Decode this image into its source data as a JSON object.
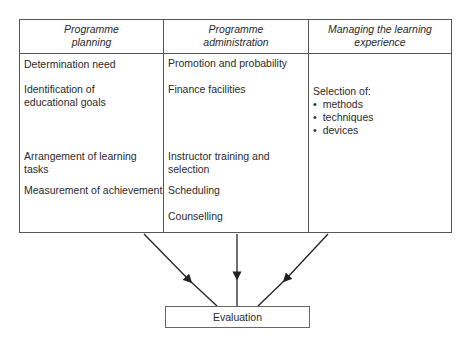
{
  "diagram": {
    "columns": [
      {
        "header": "Programme planning",
        "header_lines": [
          "Programme",
          "planning"
        ],
        "items": [
          {
            "lines": [
              "Determination need"
            ]
          },
          {
            "lines": [
              "Identification of",
              "educational goals"
            ]
          },
          {
            "lines": [
              "Arrangement of learning tasks"
            ]
          },
          {
            "lines": [
              "Measurement of achievement"
            ]
          }
        ]
      },
      {
        "header": "Programme administration",
        "header_lines": [
          "Programme",
          "administration"
        ],
        "items": [
          {
            "lines": [
              "Promotion and probability"
            ]
          },
          {
            "lines": [
              "Finance facilities"
            ]
          },
          {
            "lines": [
              "Instructor training and",
              "selection"
            ]
          },
          {
            "lines": [
              "Scheduling"
            ]
          },
          {
            "lines": [
              "Counselling"
            ]
          }
        ]
      },
      {
        "header": "Managing the learning experience",
        "header_lines": [
          "Managing the learning",
          "experience"
        ],
        "intro": "Selection of:",
        "bullets": [
          "methods",
          "techniques",
          "devices"
        ]
      }
    ],
    "result_box": "Evaluation",
    "edges": [
      {
        "from": "Programme planning",
        "to": "Evaluation"
      },
      {
        "from": "Programme administration",
        "to": "Evaluation"
      },
      {
        "from": "Managing the learning experience",
        "to": "Evaluation"
      }
    ]
  }
}
